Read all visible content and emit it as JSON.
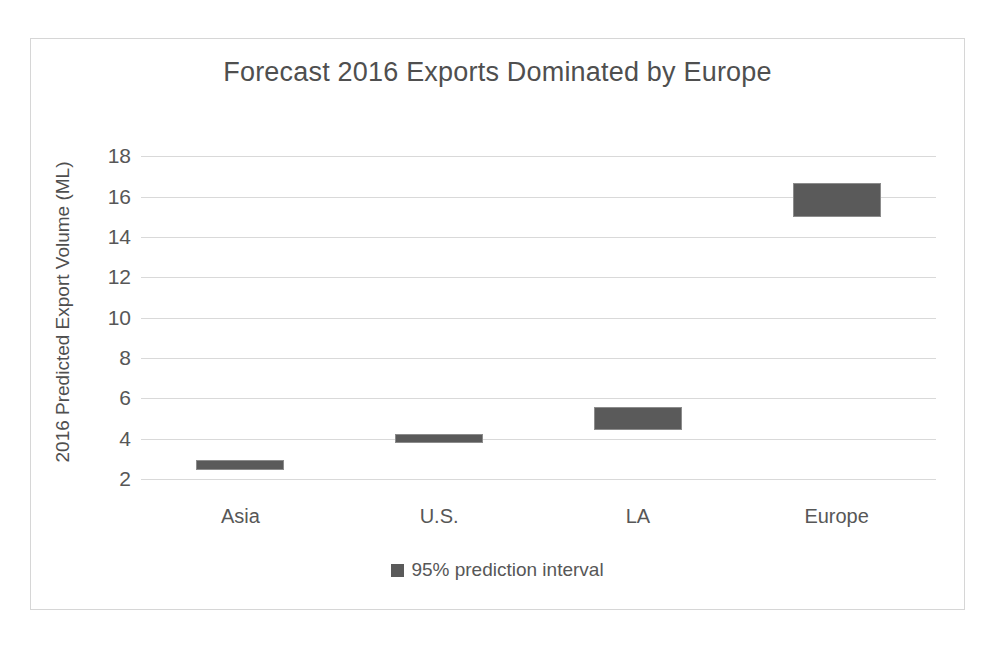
{
  "chart_data": {
    "type": "bar",
    "title": "Forecast 2016 Exports Dominated by Europe",
    "xlabel": "",
    "ylabel": "2016 Predicted Export Volume (ML)",
    "categories": [
      "Asia",
      "U.S.",
      "LA",
      "Europe"
    ],
    "ylim": [
      1.2,
      19.0
    ],
    "yticks": [
      2,
      4,
      6,
      8,
      10,
      12,
      14,
      16,
      18
    ],
    "grid": true,
    "legend_position": "bottom",
    "series": [
      {
        "name": "95% prediction interval",
        "color": "#5a5a5a",
        "type": "range",
        "values": [
          {
            "category": "Asia",
            "low": 2.45,
            "high": 2.95
          },
          {
            "category": "U.S.",
            "low": 3.8,
            "high": 4.2
          },
          {
            "category": "LA",
            "low": 4.4,
            "high": 5.55
          },
          {
            "category": "Europe",
            "low": 15.0,
            "high": 16.65
          }
        ]
      }
    ],
    "legend": [
      "95% prediction interval"
    ],
    "colors": {
      "bar_fill": "#5a5a5a",
      "bar_border": "#8c8c8c",
      "gridline": "#d9d9d9",
      "text": "#575757",
      "title_text": "#4f4f4f",
      "frame_border": "#d6d6d6",
      "background": "#ffffff"
    }
  }
}
